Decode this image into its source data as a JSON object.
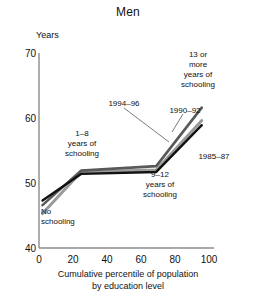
{
  "chart_data": {
    "type": "line",
    "title": "Men",
    "xlabel_line1": "Cumulative percentile of population",
    "xlabel_line2": "by education level",
    "ylabel": "Years",
    "xlim": [
      0,
      100
    ],
    "ylim": [
      40,
      70
    ],
    "xticks": [
      0,
      20,
      40,
      60,
      80,
      100
    ],
    "yticks": [
      40,
      50,
      60,
      70
    ],
    "grid": false,
    "legend": "inline-annotations",
    "x": [
      2,
      24,
      67,
      93
    ],
    "series": [
      {
        "name": "1994–96",
        "color": "#595959",
        "values": [
          46.6,
          51.9,
          52.6,
          61.6
        ]
      },
      {
        "name": "1990–92",
        "color": "#9a9a9a",
        "values": [
          45.3,
          51.7,
          52.0,
          59.6
        ]
      },
      {
        "name": "1985–87",
        "color": "#111111",
        "values": [
          47.3,
          51.4,
          51.7,
          58.9
        ]
      }
    ],
    "annotations": [
      {
        "id": "no-schooling",
        "text_lines": [
          "No",
          "schooling"
        ]
      },
      {
        "id": "1-8-years",
        "text_lines": [
          "1–8",
          "years of",
          "schooling"
        ]
      },
      {
        "id": "9-12-years",
        "text_lines": [
          "9–12",
          "years of",
          "schooling"
        ]
      },
      {
        "id": "13-or-more",
        "text_lines": [
          "13 or",
          "more",
          "years of",
          "schooling"
        ]
      },
      {
        "id": "series-1994-96",
        "text_lines": [
          "1994–96"
        ]
      },
      {
        "id": "series-1990-92",
        "text_lines": [
          "1990–92"
        ]
      },
      {
        "id": "series-1985-87",
        "text_lines": [
          "1985–87"
        ]
      }
    ]
  },
  "axis": {
    "unit_label": "Years",
    "yticks": [
      "70",
      "60",
      "50",
      "40"
    ],
    "xticks": [
      "0",
      "20",
      "40",
      "60",
      "80",
      "100"
    ]
  },
  "annotations_text": {
    "no_schooling_l1": "No",
    "no_schooling_l2": "schooling",
    "y1_8_l1": "1–8",
    "y1_8_l2": "years of",
    "y1_8_l3": "schooling",
    "y9_12_l1": "9–12",
    "y9_12_l2": "years of",
    "y9_12_l3": "schooling",
    "y13_l1": "13 or",
    "y13_l2": "more",
    "y13_l3": "years of",
    "y13_l4": "schooling",
    "s1994": "1994–96",
    "s1990": "1990–92",
    "s1985": "1985–87"
  }
}
